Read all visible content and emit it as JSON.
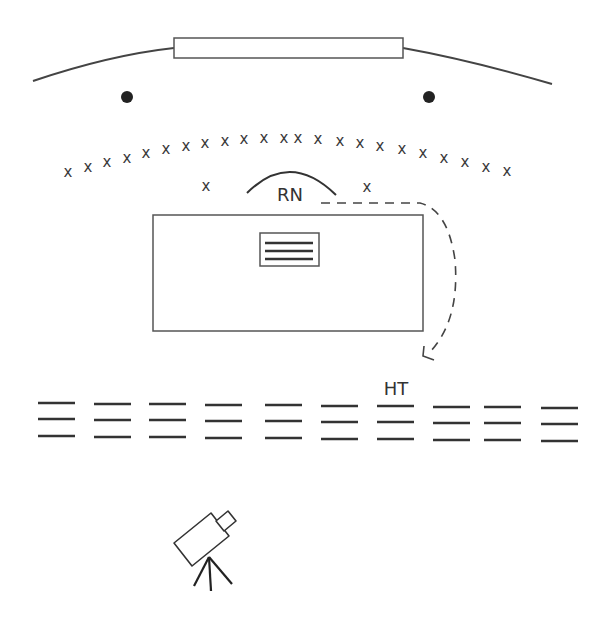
{
  "diagram": {
    "title": "",
    "colors": {
      "stroke": "#444444",
      "text": "#333333",
      "background": "#ffffff"
    },
    "screen": {
      "label": "",
      "rect": {
        "x": 174,
        "y": 38,
        "w": 229,
        "h": 20
      },
      "left_arc": "M33,81 Q110,55 174,48",
      "right_arc": "M403,48 Q470,60 552,84"
    },
    "dots": [
      {
        "cx": 127,
        "cy": 97,
        "r": 6
      },
      {
        "cx": 429,
        "cy": 97,
        "r": 6
      }
    ],
    "audience_arc_marks": {
      "glyph": "x",
      "count": 23,
      "positions": [
        [
          68,
          172
        ],
        [
          88,
          167
        ],
        [
          107,
          162
        ],
        [
          127,
          158
        ],
        [
          146,
          153
        ],
        [
          166,
          149
        ],
        [
          186,
          146
        ],
        [
          205,
          143
        ],
        [
          225,
          141
        ],
        [
          244,
          139
        ],
        [
          264,
          138
        ],
        [
          284,
          138
        ],
        [
          298,
          138
        ],
        [
          318,
          139
        ],
        [
          340,
          141
        ],
        [
          360,
          143
        ],
        [
          380,
          146
        ],
        [
          402,
          149
        ],
        [
          423,
          153
        ],
        [
          444,
          158
        ],
        [
          465,
          162
        ],
        [
          486,
          167
        ],
        [
          507,
          171
        ]
      ]
    },
    "extra_marks": [
      {
        "glyph": "x",
        "x": 206,
        "y": 186
      },
      {
        "glyph": "x",
        "x": 367,
        "y": 187
      }
    ],
    "rn": {
      "label": "RN",
      "arc": "M247,193 Q290,150 336,195",
      "label_x": 290,
      "label_y": 201
    },
    "table": {
      "rect": {
        "x": 153,
        "y": 215,
        "w": 270,
        "h": 116
      },
      "document": {
        "rect": {
          "x": 260,
          "y": 233,
          "w": 59,
          "h": 33
        },
        "lines_y": [
          243,
          251,
          259
        ]
      }
    },
    "movement_path": {
      "style": "dashed",
      "d": "M321,203 L420,203 Q448,210 455,260 Q460,320 430,352",
      "arrowhead": "M424,346 L423,356 L434,360"
    },
    "rows": {
      "label": "HT",
      "label_x": 396,
      "label_y": 395,
      "groups": [
        {
          "x1": 38,
          "x2": 75,
          "ys": [
            403,
            419,
            436
          ]
        },
        {
          "x1": 94,
          "x2": 131,
          "ys": [
            404,
            420,
            437
          ]
        },
        {
          "x1": 149,
          "x2": 186,
          "ys": [
            404,
            420,
            437
          ]
        },
        {
          "x1": 205,
          "x2": 242,
          "ys": [
            405,
            421,
            438
          ]
        },
        {
          "x1": 265,
          "x2": 302,
          "ys": [
            405,
            421,
            438
          ]
        },
        {
          "x1": 321,
          "x2": 358,
          "ys": [
            406,
            422,
            439
          ]
        },
        {
          "x1": 377,
          "x2": 414,
          "ys": [
            406,
            422,
            439
          ]
        },
        {
          "x1": 433,
          "x2": 470,
          "ys": [
            407,
            423,
            440
          ]
        },
        {
          "x1": 484,
          "x2": 521,
          "ys": [
            407,
            423,
            440
          ]
        },
        {
          "x1": 541,
          "x2": 578,
          "ys": [
            408,
            424,
            441
          ]
        }
      ]
    },
    "camera": {
      "body": "M174,543 L211,513 L229,536 L192,566 Z",
      "lens": "M216,521 L228,511 L236,521 L224,531 Z",
      "tripod_apex": [
        209,
        557
      ],
      "legs": [
        [
          194,
          586
        ],
        [
          211,
          591
        ],
        [
          232,
          584
        ]
      ]
    }
  }
}
